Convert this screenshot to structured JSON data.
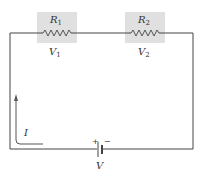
{
  "diagram": {
    "type": "series-circuit",
    "components": [
      {
        "id": "R1",
        "kind": "resistor",
        "label": "R",
        "label_sub": "1",
        "voltage_label": "V",
        "voltage_sub": "1",
        "highlight": "#e0e0e0"
      },
      {
        "id": "R2",
        "kind": "resistor",
        "label": "R",
        "label_sub": "2",
        "voltage_label": "V",
        "voltage_sub": "2",
        "highlight": "#e0e0e0"
      },
      {
        "id": "battery",
        "kind": "battery",
        "label": "V",
        "plus": "+",
        "minus": "−"
      }
    ],
    "current": {
      "label": "I",
      "direction": "counter-clockwise"
    },
    "colors": {
      "wire": "#444444",
      "highlight": "#e0e0e0",
      "text": "#333333"
    }
  }
}
